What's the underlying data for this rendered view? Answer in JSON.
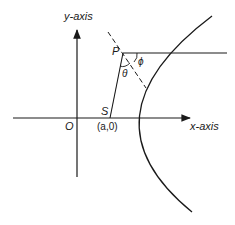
{
  "diagram": {
    "type": "parabola-reflection",
    "labels": {
      "y_axis": "y-axis",
      "x_axis": "x-axis",
      "origin": "O",
      "focus": "S",
      "focus_coords": "(a,0)",
      "point": "P",
      "angle_theta": "θ",
      "angle_phi": "ϕ"
    },
    "colors": {
      "stroke": "#1a1a1a",
      "background": "#ffffff"
    }
  }
}
